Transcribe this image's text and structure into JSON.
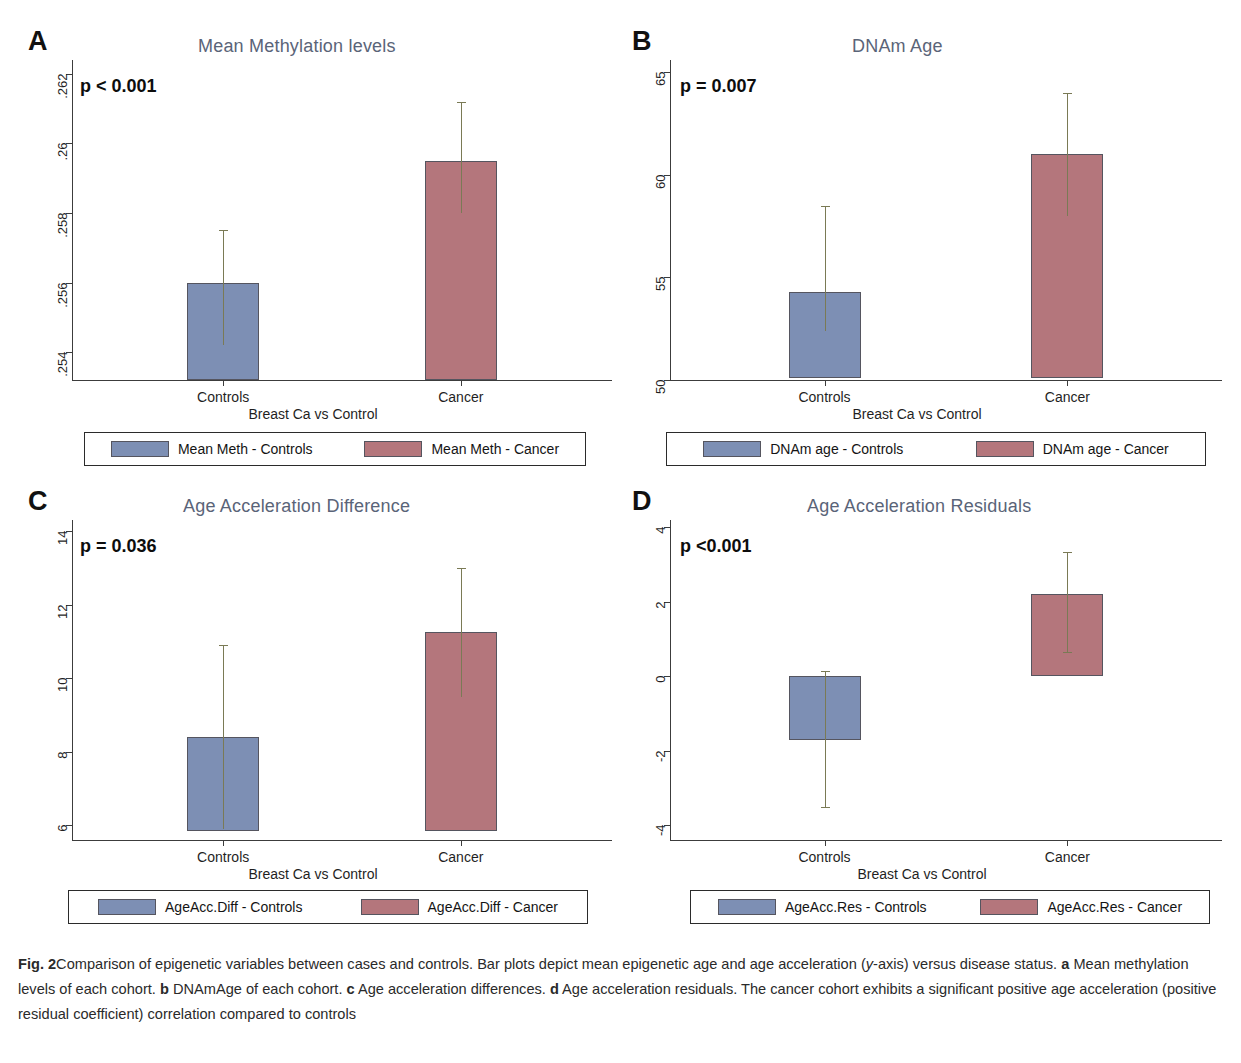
{
  "colors": {
    "controls": "#7d8fb4",
    "cancer": "#b4767c",
    "error_bar": "#7a7a55",
    "title": "#5a6478",
    "axis": "#3c3c3c"
  },
  "caption": {
    "figure_label": "Fig. 2",
    "text_1": "Comparison of epigenetic variables between cases and controls. Bar plots depict mean epigenetic age and age acceleration (",
    "yaxis_italic": "y",
    "text_2": "-axis) versus disease status. ",
    "a_label": "a",
    "text_a": " Mean methylation levels of each cohort. ",
    "b_label": "b",
    "text_b": " DNAmAge of each cohort. ",
    "c_label": "c",
    "text_c": " Age acceleration differences. ",
    "d_label": "d",
    "text_d": " Age acceleration residuals. The cancer cohort exhibits a significant positive age acceleration (positive residual coefficient) correlation compared to controls"
  },
  "chart_data": [
    {
      "panel": "A",
      "type": "bar",
      "title": "Mean Methylation levels",
      "pvalue": "p < 0.001",
      "xlabel": "Breast Ca vs Control",
      "ylabel": "",
      "categories": [
        "Controls",
        "Cancer"
      ],
      "ytick_labels": [
        ".254",
        ".256",
        ".258",
        ".26",
        ".262"
      ],
      "ytick_values": [
        0.254,
        0.256,
        0.258,
        0.26,
        0.262
      ],
      "ylim": [
        0.2532,
        0.2624
      ],
      "baseline": 0.2532,
      "values": [
        0.256,
        0.2595
      ],
      "error_upper": [
        0.2575,
        0.2612
      ],
      "error_lower": [
        0.2542,
        0.258
      ],
      "series": [
        {
          "name": "Mean Meth - Controls",
          "color": "#7d8fb4",
          "value": 0.256,
          "err_hi": 0.2575,
          "err_lo": 0.2542
        },
        {
          "name": "Mean Meth - Cancer",
          "color": "#b4767c",
          "value": 0.2595,
          "err_hi": 0.2612,
          "err_lo": 0.258
        }
      ],
      "legend": [
        "Mean Meth - Controls",
        "Mean Meth - Cancer"
      ],
      "grid": false,
      "legend_position": "bottom"
    },
    {
      "panel": "B",
      "type": "bar",
      "title": "DNAm Age",
      "pvalue": "p = 0.007",
      "xlabel": "Breast Ca vs Control",
      "ylabel": "",
      "categories": [
        "Controls",
        "Cancer"
      ],
      "ytick_labels": [
        "50",
        "55",
        "60",
        "65"
      ],
      "ytick_values": [
        50,
        55,
        60,
        65
      ],
      "ylim": [
        50,
        65.6
      ],
      "baseline": 50.1,
      "values": [
        54.3,
        61.0
      ],
      "error_upper": [
        58.5,
        64.0
      ],
      "error_lower": [
        52.4,
        58.0
      ],
      "series": [
        {
          "name": "DNAm age - Controls",
          "color": "#7d8fb4",
          "value": 54.3,
          "err_hi": 58.5,
          "err_lo": 52.4
        },
        {
          "name": "DNAm age - Cancer",
          "color": "#b4767c",
          "value": 61.0,
          "err_hi": 64.0,
          "err_lo": 58.0
        }
      ],
      "legend": [
        "DNAm age - Controls",
        "DNAm age - Cancer"
      ],
      "grid": false,
      "legend_position": "bottom"
    },
    {
      "panel": "C",
      "type": "bar",
      "title": "Age Acceleration Difference",
      "pvalue": "p = 0.036",
      "xlabel": "Breast Ca vs Control",
      "ylabel": "",
      "categories": [
        "Controls",
        "Cancer"
      ],
      "ytick_labels": [
        "6",
        "8",
        "10",
        "12",
        "14"
      ],
      "ytick_values": [
        6,
        8,
        10,
        12,
        14
      ],
      "ylim": [
        5.6,
        14.3
      ],
      "baseline": 5.85,
      "values": [
        8.4,
        11.25
      ],
      "error_upper": [
        10.9,
        13.0
      ],
      "error_lower": [
        5.9,
        9.5
      ],
      "series": [
        {
          "name": "AgeAcc.Diff - Controls",
          "color": "#7d8fb4",
          "value": 8.4,
          "err_hi": 10.9,
          "err_lo": 5.9
        },
        {
          "name": "AgeAcc.Diff - Cancer",
          "color": "#b4767c",
          "value": 11.25,
          "err_hi": 13.0,
          "err_lo": 9.5
        }
      ],
      "legend": [
        "AgeAcc.Diff - Controls",
        "AgeAcc.Diff - Cancer"
      ],
      "grid": false,
      "legend_position": "bottom"
    },
    {
      "panel": "D",
      "type": "bar",
      "title": "Age Acceleration Residuals",
      "pvalue": "p <0.001",
      "xlabel": "Breast Ca vs Control",
      "ylabel": "",
      "categories": [
        "Controls",
        "Cancer"
      ],
      "ytick_labels": [
        "-4",
        "-2",
        "0",
        "2",
        "4"
      ],
      "ytick_values": [
        -4,
        -2,
        0,
        2,
        4
      ],
      "ylim": [
        -4.4,
        4.2
      ],
      "baseline": 0,
      "values": [
        -1.7,
        2.2
      ],
      "error_upper": [
        0.15,
        3.35
      ],
      "error_lower": [
        -3.5,
        0.65
      ],
      "series": [
        {
          "name": "AgeAcc.Res - Controls",
          "color": "#7d8fb4",
          "value": -1.7,
          "err_hi": 0.15,
          "err_lo": -3.5
        },
        {
          "name": "AgeAcc.Res - Cancer",
          "color": "#b4767c",
          "value": 2.2,
          "err_hi": 3.35,
          "err_lo": 0.65
        }
      ],
      "legend": [
        "AgeAcc.Res - Controls",
        "AgeAcc.Res - Cancer"
      ],
      "grid": false,
      "legend_position": "bottom"
    }
  ]
}
